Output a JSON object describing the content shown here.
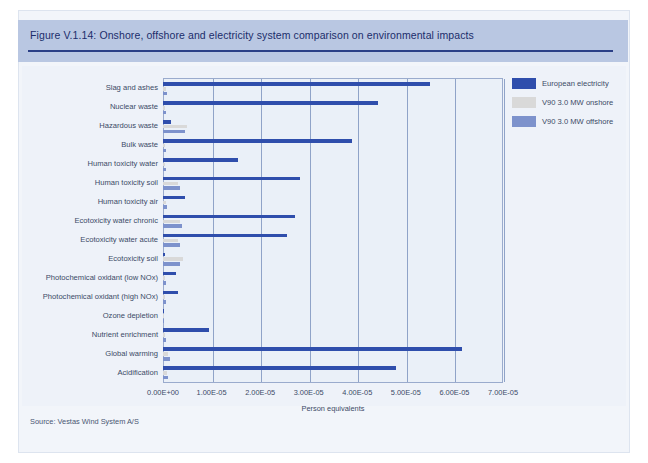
{
  "figure": {
    "title": "Figure V.1.14: Onshore, offshore and electricity system comparison on environmental impacts",
    "source": "Source: Vestas Wind System A/S"
  },
  "legend": {
    "position": "right",
    "items": [
      {
        "label": "European electricity",
        "color": "#2f4eac"
      },
      {
        "label": "V90 3.0 MW onshore",
        "color": "#d9d9d9"
      },
      {
        "label": "V90 3.0 MW offshore",
        "color": "#7d92cc"
      }
    ]
  },
  "chart_data": {
    "type": "bar",
    "orientation": "horizontal",
    "title": "Figure V.1.14: Onshore, offshore and electricity system comparison on environmental impacts",
    "xlabel": "Person equivalents",
    "ylabel": "",
    "xlim": [
      0,
      7e-05
    ],
    "xticks": [
      0,
      1e-05,
      2e-05,
      3e-05,
      4e-05,
      5e-05,
      6e-05,
      7e-05
    ],
    "xtick_labels": [
      "0.00E+00",
      "1.00E-05",
      "2.00E-05",
      "3.00E-05",
      "4.00E-05",
      "5.00E-05",
      "6.00E-05",
      "7.00E-05"
    ],
    "grid": true,
    "legend_position": "right",
    "categories": [
      "Slag and ashes",
      "Nuclear waste",
      "Hazardous waste",
      "Bulk waste",
      "Human toxicity water",
      "Human toxicity soil",
      "Human toxicity air",
      "Ecotoxicity water chronic",
      "Ecotoxicity water acute",
      "Ecotoxicity soil",
      "Photochemical oxidant (low NOx)",
      "Photochemical oxidant (high NOx)",
      "Ozone depletion",
      "Nutrient enrichment",
      "Global warming",
      "Acidification"
    ],
    "series": [
      {
        "name": "European electricity",
        "color": "#2f4eac",
        "values": [
          5.5e-05,
          4.42e-05,
          1.6e-06,
          3.9e-05,
          1.55e-05,
          2.82e-05,
          4.5e-06,
          2.72e-05,
          2.55e-05,
          5e-07,
          2.6e-06,
          3e-06,
          0.0,
          9.5e-06,
          6.15e-05,
          4.8e-05
        ]
      },
      {
        "name": "V90 3.0 MW onshore",
        "color": "#d9d9d9",
        "values": [
          6e-07,
          4e-07,
          5e-06,
          5e-07,
          5e-07,
          3e-06,
          6e-07,
          3.5e-06,
          3e-06,
          4.2e-06,
          5e-07,
          5e-07,
          0.0,
          5e-07,
          1e-06,
          8e-07
        ]
      },
      {
        "name": "V90 3.0 MW offshore",
        "color": "#7d92cc",
        "values": [
          8e-07,
          6e-07,
          4.6e-06,
          7e-07,
          7e-07,
          3.4e-06,
          8e-07,
          4e-06,
          3.4e-06,
          3.6e-06,
          7e-07,
          7e-07,
          0.0,
          7e-07,
          1.4e-06,
          1e-06
        ]
      }
    ]
  }
}
